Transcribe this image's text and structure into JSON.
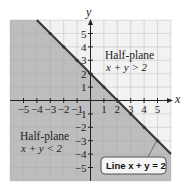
{
  "chart_data": {
    "type": "line",
    "title": "",
    "xlabel": "x",
    "ylabel": "y",
    "xlim": [
      -6,
      6
    ],
    "ylim": [
      -6,
      6
    ],
    "grid": true,
    "x_ticks": [
      -5,
      -4,
      -3,
      -2,
      -1,
      1,
      2,
      3,
      4,
      5
    ],
    "y_ticks": [
      -5,
      -4,
      -3,
      -2,
      -1,
      1,
      2,
      3,
      4,
      5
    ],
    "x_tick_labels": [
      "−5",
      "−4",
      "−3",
      "−2",
      "−1",
      "1",
      "2",
      "3",
      "4",
      "5"
    ],
    "y_tick_labels": [
      "−5",
      "−4",
      "−3",
      "−2",
      "−1",
      "1",
      "2",
      "3",
      "4",
      "5"
    ],
    "series": [
      {
        "name": "Line x + y = 2",
        "x": [
          -4,
          -3,
          -2,
          -1,
          0,
          1,
          2,
          3,
          4,
          5,
          6
        ],
        "y": [
          6,
          5,
          4,
          3,
          2,
          1,
          0,
          -1,
          -2,
          -3,
          -4
        ],
        "points_marked": [
          [
            -3,
            5
          ],
          [
            -2,
            4
          ],
          [
            -1,
            3
          ],
          [
            0,
            2
          ],
          [
            1,
            1
          ],
          [
            2,
            0
          ],
          [
            3,
            -1
          ],
          [
            4,
            -2
          ],
          [
            5,
            -3
          ]
        ]
      }
    ],
    "regions": [
      {
        "name": "Half-plane x + y > 2",
        "shaded": false
      },
      {
        "name": "Half-plane x + y < 2",
        "shaded": true
      }
    ],
    "annotations": [
      {
        "text": "Half-plane",
        "subtext": "x + y > 2",
        "position": [
          3.5,
          4
        ]
      },
      {
        "text": "Half-plane",
        "subtext": "x + y < 2",
        "position": [
          -3.5,
          -3
        ]
      },
      {
        "text": "Line x + y = 2",
        "points_to": [
          5,
          -3
        ]
      }
    ]
  },
  "labels": {
    "x_axis": "x",
    "y_axis": "y",
    "upper_region_title": "Half-plane",
    "upper_region_eq": "x + y > 2",
    "lower_region_title": "Half-plane",
    "lower_region_eq": "x + y < 2",
    "line_label": "Line x + y = 2"
  },
  "colors": {
    "shaded": "#bdbdbd",
    "unshaded": "#f2f2f2",
    "grid_light": "#c8c8c8",
    "grid_dark": "#d6d6d6",
    "line": "#3a3a3a"
  }
}
